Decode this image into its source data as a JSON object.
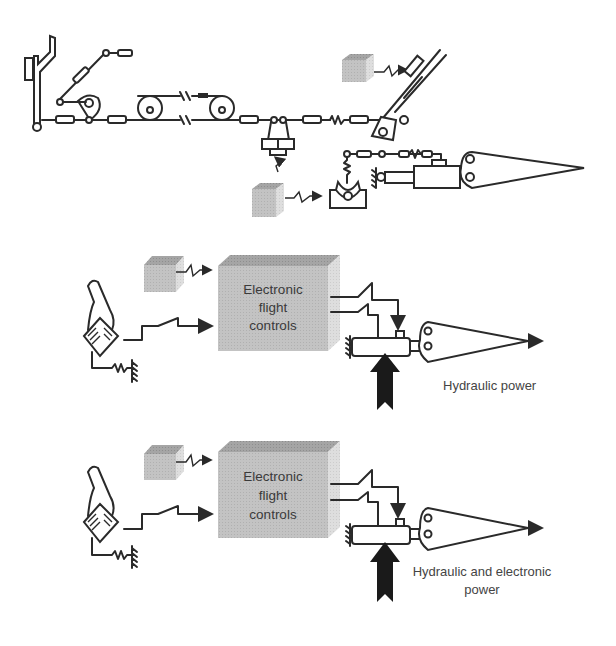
{
  "diagram": {
    "panels": [
      {
        "id": "mechanical",
        "description": "Mechanical flight control linkage: control stick, pushrods, cable pulleys, bellcranks, trim/autopilot servo boxes, hydraulic actuator driving control surface"
      },
      {
        "id": "fbw_hydraulic",
        "box_label_lines": [
          "Electronic",
          "flight",
          "controls"
        ],
        "power_label_lines": [
          "Hydraulic power"
        ]
      },
      {
        "id": "fbw_electronic",
        "box_label_lines": [
          "Electronic",
          "flight",
          "controls"
        ],
        "power_label_lines": [
          "Hydraulic and electronic",
          "power"
        ]
      }
    ],
    "colors": {
      "line": "#2a2a2a",
      "box_front": "#c4c4c4",
      "box_top": "#a9a9a9",
      "box_side": "#d9d9d9",
      "small_box_front": "#bdbdbd",
      "power_arrow": "#1a1a1a",
      "label_text": "#444444"
    }
  }
}
